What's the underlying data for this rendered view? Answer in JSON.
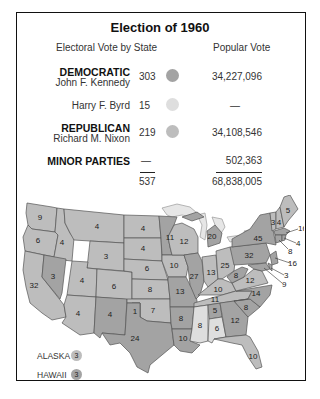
{
  "title": "Election of 1960",
  "headers": {
    "electoral": "Electoral Vote by State",
    "popular": "Popular Vote"
  },
  "colors": {
    "democratic": "#a3a3a3",
    "republican": "#bdbdbd",
    "byrd": "#dedede",
    "border": "#444444",
    "lakes": "#e6e6e6"
  },
  "results": [
    {
      "party": "DEMOCRATIC",
      "candidate": "John F. Kennedy",
      "electoral": "303",
      "popular": "34,227,096",
      "color": "#a3a3a3"
    },
    {
      "party": "",
      "candidate": "Harry F. Byrd",
      "electoral": "15",
      "popular": "—",
      "color": "#dedede"
    },
    {
      "party": "REPUBLICAN",
      "candidate": "Richard M. Nixon",
      "electoral": "219",
      "popular": "34,108,546",
      "color": "#bdbdbd"
    },
    {
      "party": "MINOR PARTIES",
      "candidate": "",
      "electoral": "—",
      "popular": "502,363",
      "color": ""
    }
  ],
  "totals": {
    "electoral": "537",
    "popular": "68,838,005"
  },
  "map": {
    "states": [
      {
        "name": "Washington",
        "votes": "9",
        "party": "R"
      },
      {
        "name": "Oregon",
        "votes": "6",
        "party": "R"
      },
      {
        "name": "California",
        "votes": "32",
        "party": "R"
      },
      {
        "name": "Idaho",
        "votes": "4",
        "party": "R"
      },
      {
        "name": "Nevada",
        "votes": "3",
        "party": "D"
      },
      {
        "name": "Montana",
        "votes": "4",
        "party": "R"
      },
      {
        "name": "Wyoming",
        "votes": "3",
        "party": "R"
      },
      {
        "name": "Utah",
        "votes": "4",
        "party": "R"
      },
      {
        "name": "Arizona",
        "votes": "4",
        "party": "R"
      },
      {
        "name": "Colorado",
        "votes": "6",
        "party": "R"
      },
      {
        "name": "New Mexico",
        "votes": "4",
        "party": "D"
      },
      {
        "name": "North Dakota",
        "votes": "4",
        "party": "R"
      },
      {
        "name": "South Dakota",
        "votes": "4",
        "party": "R"
      },
      {
        "name": "Nebraska",
        "votes": "6",
        "party": "R"
      },
      {
        "name": "Kansas",
        "votes": "8",
        "party": "R"
      },
      {
        "name": "Oklahoma (Byrd)",
        "votes": "1",
        "party": "B"
      },
      {
        "name": "Oklahoma",
        "votes": "7",
        "party": "R"
      },
      {
        "name": "Texas",
        "votes": "24",
        "party": "D"
      },
      {
        "name": "Minnesota",
        "votes": "11",
        "party": "D"
      },
      {
        "name": "Iowa",
        "votes": "10",
        "party": "R"
      },
      {
        "name": "Missouri",
        "votes": "13",
        "party": "D"
      },
      {
        "name": "Arkansas",
        "votes": "8",
        "party": "D"
      },
      {
        "name": "Louisiana",
        "votes": "10",
        "party": "D"
      },
      {
        "name": "Wisconsin",
        "votes": "12",
        "party": "R"
      },
      {
        "name": "Illinois",
        "votes": "27",
        "party": "D"
      },
      {
        "name": "Michigan",
        "votes": "20",
        "party": "D"
      },
      {
        "name": "Indiana",
        "votes": "13",
        "party": "R"
      },
      {
        "name": "Ohio",
        "votes": "25",
        "party": "R"
      },
      {
        "name": "Kentucky",
        "votes": "10",
        "party": "R"
      },
      {
        "name": "Tennessee",
        "votes": "11",
        "party": "R"
      },
      {
        "name": "Mississippi",
        "votes": "8",
        "party": "B"
      },
      {
        "name": "Alabama (Kennedy)",
        "votes": "5",
        "party": "D"
      },
      {
        "name": "Alabama (Byrd)",
        "votes": "6",
        "party": "B"
      },
      {
        "name": "Georgia",
        "votes": "12",
        "party": "D"
      },
      {
        "name": "Florida",
        "votes": "10",
        "party": "R"
      },
      {
        "name": "South Carolina",
        "votes": "8",
        "party": "D"
      },
      {
        "name": "North Carolina",
        "votes": "14",
        "party": "D"
      },
      {
        "name": "Virginia",
        "votes": "12",
        "party": "R"
      },
      {
        "name": "West Virginia",
        "votes": "8",
        "party": "D"
      },
      {
        "name": "Pennsylvania",
        "votes": "32",
        "party": "D"
      },
      {
        "name": "New York",
        "votes": "45",
        "party": "D"
      },
      {
        "name": "Vermont",
        "votes": "3",
        "party": "R"
      },
      {
        "name": "New Hampshire",
        "votes": "4",
        "party": "R"
      },
      {
        "name": "Maine",
        "votes": "5",
        "party": "R"
      },
      {
        "name": "Massachusetts",
        "votes": "16",
        "party": "D"
      },
      {
        "name": "Rhode Island",
        "votes": "4",
        "party": "D"
      },
      {
        "name": "Connecticut",
        "votes": "8",
        "party": "D"
      },
      {
        "name": "New Jersey",
        "votes": "16",
        "party": "D"
      },
      {
        "name": "Delaware",
        "votes": "3",
        "party": "D"
      },
      {
        "name": "Maryland",
        "votes": "9",
        "party": "D"
      }
    ],
    "insets": [
      {
        "name": "ALASKA",
        "votes": "3",
        "party": "R"
      },
      {
        "name": "HAWAII",
        "votes": "3",
        "party": "D"
      }
    ]
  }
}
